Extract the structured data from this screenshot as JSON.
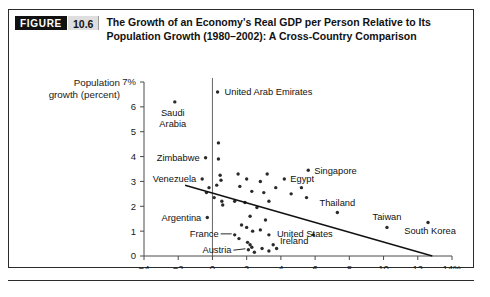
{
  "figure": {
    "badge_label": "FIGURE",
    "number": "10.6",
    "title_line1": "The Growth of an Economy's Real GDP per Person Relative to Its",
    "title_line2": "Population Growth (1980–2002): A Cross-Country Comparison"
  },
  "colors": {
    "badge_bg": "#111111",
    "badge_fg": "#ffffff",
    "number_bg": "#dedede",
    "frame": "#2b2b2b",
    "point": "#2a2a2a",
    "trend": "#111111",
    "axis": "#4a4a4a"
  },
  "chart_data": {
    "type": "scatter",
    "title": "The Growth of an Economy's Real GDP per Person Relative to Its Population Growth (1980–2002): A Cross-Country Comparison",
    "xlabel": "Growth of real GDP per person (percent)",
    "ylabel_line1": "Population",
    "ylabel_line2": "growth (percent)",
    "xlim": [
      -4,
      14
    ],
    "ylim": [
      0,
      7
    ],
    "xticks": [
      -4,
      -2,
      0,
      2,
      4,
      6,
      8,
      10,
      12,
      14
    ],
    "xticklabels": [
      "−4",
      "−2",
      "0",
      "2",
      "4",
      "6",
      "8",
      "10",
      "12",
      "14%"
    ],
    "yticks": [
      0,
      1,
      2,
      3,
      4,
      5,
      6,
      7
    ],
    "yticklabels": [
      "0",
      "1",
      "2",
      "3",
      "4",
      "5",
      "6",
      "7%"
    ],
    "grid": false,
    "legend": false,
    "reference_line_x": 0,
    "trend_line": {
      "x0": -1.6,
      "y0": 2.85,
      "x1": 12.85,
      "y1": 0.0,
      "note": "downward-sloping fitted line"
    },
    "points": [
      {
        "x": 0.3,
        "y": 6.6,
        "label": "United Arab Emirates",
        "label_pos": "right"
      },
      {
        "x": -2.2,
        "y": 6.2,
        "label": "Saudi Arabia",
        "label_pos": "below"
      },
      {
        "x": 0.35,
        "y": 4.55,
        "label": ""
      },
      {
        "x": -0.4,
        "y": 3.95,
        "label": "Zimbabwe",
        "label_pos": "left"
      },
      {
        "x": 0.35,
        "y": 3.9,
        "label": ""
      },
      {
        "x": -0.6,
        "y": 3.1,
        "label": "Venezuela",
        "label_pos": "left"
      },
      {
        "x": 0.45,
        "y": 3.25,
        "label": ""
      },
      {
        "x": 0.5,
        "y": 3.05,
        "label": ""
      },
      {
        "x": 0.25,
        "y": 2.85,
        "label": ""
      },
      {
        "x": -0.2,
        "y": 2.75,
        "label": ""
      },
      {
        "x": -0.35,
        "y": 2.55,
        "label": ""
      },
      {
        "x": 0.1,
        "y": 2.35,
        "label": ""
      },
      {
        "x": 0.55,
        "y": 2.2,
        "label": ""
      },
      {
        "x": 0.6,
        "y": 2.05,
        "label": ""
      },
      {
        "x": -0.3,
        "y": 1.55,
        "label": "Argentina",
        "label_pos": "left"
      },
      {
        "x": 1.5,
        "y": 3.3,
        "label": ""
      },
      {
        "x": 2.0,
        "y": 3.1,
        "label": ""
      },
      {
        "x": 1.6,
        "y": 2.8,
        "label": ""
      },
      {
        "x": 2.3,
        "y": 2.6,
        "label": ""
      },
      {
        "x": 2.8,
        "y": 3.0,
        "label": ""
      },
      {
        "x": 3.2,
        "y": 3.3,
        "label": ""
      },
      {
        "x": 3.0,
        "y": 2.55,
        "label": ""
      },
      {
        "x": 3.7,
        "y": 2.75,
        "label": ""
      },
      {
        "x": 4.2,
        "y": 3.1,
        "label": "Egypt",
        "label_pos": "right"
      },
      {
        "x": 5.6,
        "y": 3.45,
        "label": "Singapore",
        "label_pos": "right"
      },
      {
        "x": 4.6,
        "y": 2.5,
        "label": ""
      },
      {
        "x": 5.2,
        "y": 2.75,
        "label": ""
      },
      {
        "x": 5.5,
        "y": 2.35,
        "label": ""
      },
      {
        "x": 1.3,
        "y": 2.2,
        "label": ""
      },
      {
        "x": 1.9,
        "y": 2.15,
        "label": ""
      },
      {
        "x": 2.6,
        "y": 1.95,
        "label": ""
      },
      {
        "x": 3.3,
        "y": 2.2,
        "label": ""
      },
      {
        "x": 2.2,
        "y": 1.6,
        "label": ""
      },
      {
        "x": 3.1,
        "y": 1.45,
        "label": ""
      },
      {
        "x": 1.7,
        "y": 1.25,
        "label": ""
      },
      {
        "x": 2.0,
        "y": 1.15,
        "label": ""
      },
      {
        "x": 2.35,
        "y": 1.0,
        "label": ""
      },
      {
        "x": 2.8,
        "y": 1.05,
        "label": ""
      },
      {
        "x": 1.3,
        "y": 0.85,
        "label": "France",
        "label_pos": "left"
      },
      {
        "x": 1.55,
        "y": 0.7,
        "label": ""
      },
      {
        "x": 3.3,
        "y": 0.85,
        "label": "United States",
        "label_pos": "right"
      },
      {
        "x": 2.05,
        "y": 0.55,
        "label": ""
      },
      {
        "x": 2.2,
        "y": 0.45,
        "label": ""
      },
      {
        "x": 2.3,
        "y": 0.35,
        "label": ""
      },
      {
        "x": 2.1,
        "y": 0.25,
        "label": "Austria",
        "label_pos": "left"
      },
      {
        "x": 2.45,
        "y": 0.15,
        "label": ""
      },
      {
        "x": 2.9,
        "y": 0.3,
        "label": ""
      },
      {
        "x": 3.3,
        "y": 0.2,
        "label": ""
      },
      {
        "x": 3.55,
        "y": 0.45,
        "label": ""
      },
      {
        "x": 3.75,
        "y": 0.3,
        "label": ""
      },
      {
        "x": 5.9,
        "y": 0.85,
        "label": "Ireland",
        "label_pos": "left"
      },
      {
        "x": 7.3,
        "y": 1.75,
        "label": "Thailand",
        "label_pos": "above"
      },
      {
        "x": 10.2,
        "y": 1.15,
        "label": "Taiwan",
        "label_pos": "above"
      },
      {
        "x": 12.6,
        "y": 1.35,
        "label": "South Korea",
        "label_pos": "below"
      }
    ],
    "annotations": [
      "United Arab Emirates",
      "Saudi Arabia",
      "Zimbabwe",
      "Venezuela",
      "Argentina",
      "Singapore",
      "Egypt",
      "Thailand",
      "Taiwan",
      "South Korea",
      "France",
      "United States",
      "Austria",
      "Ireland"
    ]
  }
}
